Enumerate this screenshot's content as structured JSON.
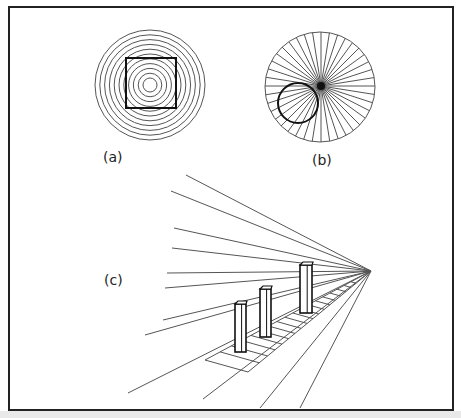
{
  "figure": {
    "frame": {
      "x": 9,
      "y": 7,
      "w": 444,
      "h": 403,
      "stroke": "#222222"
    },
    "colors": {
      "line": "#555555",
      "dark": "#111111",
      "bg": "#ffffff",
      "band": "#e9e9e9"
    },
    "panels": [
      {
        "id": "a",
        "label": "(a)",
        "label_pos": [
          103,
          162
        ],
        "description": "Concentric circles with superimposed square",
        "circles": {
          "cx": 150,
          "cy": 85,
          "r_min": 7,
          "r_max": 55,
          "count": 11
        },
        "square": {
          "x": 126,
          "y": 58,
          "size": 50
        }
      },
      {
        "id": "b",
        "label": "(b)",
        "label_pos": [
          312,
          165
        ],
        "description": "Radiating lines with superimposed circle",
        "outer_circle": {
          "cx": 320,
          "cy": 87,
          "r": 55
        },
        "convergence": [
          321,
          86
        ],
        "ray_count": 40,
        "inner_circle": {
          "cx": 298,
          "cy": 103,
          "r": 20
        }
      },
      {
        "id": "c",
        "label": "(c)",
        "label_pos": [
          104,
          285
        ],
        "description": "Perspective lines with three identical pillars on a receding track",
        "vanishing_point": [
          371,
          271
        ],
        "line_starts": [
          [
            186,
            175
          ],
          [
            171,
            191
          ],
          [
            174,
            228
          ],
          [
            172,
            248
          ],
          [
            167,
            273
          ],
          [
            165,
            288
          ],
          [
            163,
            320
          ],
          [
            145,
            335
          ],
          [
            128,
            393
          ],
          [
            203,
            399
          ],
          [
            260,
            408
          ],
          [
            300,
            408
          ]
        ],
        "pillars": [
          {
            "x": 235,
            "top": 304,
            "bottom": 352,
            "w": 11
          },
          {
            "x": 260,
            "top": 289,
            "bottom": 337,
            "w": 11
          },
          {
            "x": 300,
            "top": 265,
            "bottom": 313,
            "w": 12
          }
        ],
        "track": {
          "near_left": [
            205,
            360
          ],
          "near_right": [
            248,
            372
          ],
          "rungs": 18
        }
      }
    ]
  }
}
